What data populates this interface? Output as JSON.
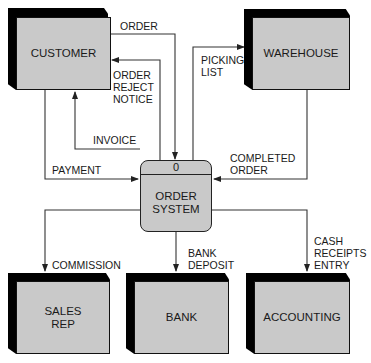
{
  "diagram": {
    "type": "context data flow diagram",
    "process": {
      "id": "0",
      "name": "ORDER\nSYSTEM"
    },
    "entities": {
      "customer": "CUSTOMER",
      "warehouse": "WAREHOUSE",
      "sales_rep": "SALES\nREP",
      "bank": "BANK",
      "accounting": "ACCOUNTING"
    },
    "flows": {
      "order": "ORDER",
      "order_reject_notice": "ORDER\nREJECT\nNOTICE",
      "invoice": "INVOICE",
      "payment": "PAYMENT",
      "picking_list": "PICKING\nLIST",
      "completed_order": "COMPLETED\nORDER",
      "commission": "COMMISSION",
      "bank_deposit": "BANK\nDEPOSIT",
      "cash_receipts_entry": "CASH\nRECEIPTS\nENTRY"
    },
    "colors": {
      "box_face": "#c9c9c9",
      "box_shadow": "#000000",
      "line": "#222222"
    }
  }
}
